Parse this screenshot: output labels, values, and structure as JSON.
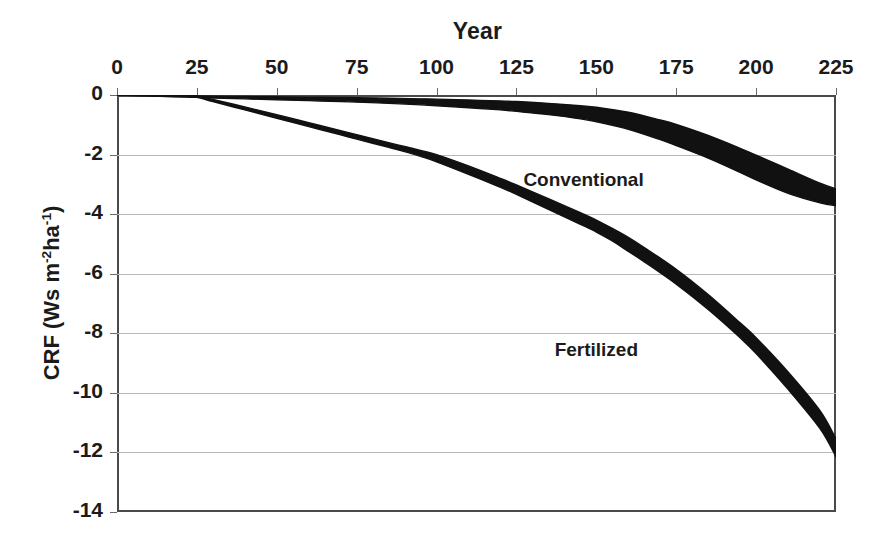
{
  "chart_data": {
    "type": "line",
    "title": "Year",
    "xlabel": "Year",
    "ylabel": "CRF (Ws m-2ha-1)",
    "ylabel_parts": {
      "prefix": "CRF (Ws m",
      "sup1": "-2",
      "mid": "ha",
      "sup2": "-1",
      "suffix": ")"
    },
    "xlim": [
      0,
      225
    ],
    "ylim": [
      -14,
      0
    ],
    "grid": true,
    "grid_axis": "y",
    "legend_position": "inline-annotation",
    "xticks": [
      0,
      25,
      50,
      75,
      100,
      125,
      150,
      175,
      200,
      225
    ],
    "xtick_labels": [
      "0",
      "25",
      "50",
      "75",
      "100",
      "125",
      "150",
      "175",
      "200",
      "225"
    ],
    "yticks": [
      0,
      -2,
      -4,
      -6,
      -8,
      -10,
      -12,
      -14
    ],
    "ytick_labels": [
      "0",
      "-2",
      "-4",
      "-6",
      "-8",
      "-10",
      "-12",
      "-14"
    ],
    "series": [
      {
        "name": "Conventional",
        "band": true,
        "color": "#111111",
        "x": [
          0,
          10,
          20,
          25,
          30,
          40,
          50,
          60,
          70,
          75,
          85,
          95,
          100,
          110,
          120,
          125,
          135,
          145,
          150,
          160,
          170,
          175,
          185,
          195,
          200,
          210,
          220,
          225
        ],
        "upper": [
          0.0,
          -0.01,
          -0.02,
          -0.03,
          -0.04,
          -0.05,
          -0.06,
          -0.07,
          -0.08,
          -0.09,
          -0.11,
          -0.13,
          -0.14,
          -0.17,
          -0.2,
          -0.22,
          -0.28,
          -0.36,
          -0.41,
          -0.58,
          -0.84,
          -0.99,
          -1.36,
          -1.79,
          -2.02,
          -2.49,
          -2.96,
          -3.15
        ],
        "lower": [
          0.0,
          -0.03,
          -0.06,
          -0.08,
          -0.1,
          -0.13,
          -0.16,
          -0.19,
          -0.22,
          -0.24,
          -0.28,
          -0.33,
          -0.36,
          -0.43,
          -0.5,
          -0.55,
          -0.66,
          -0.8,
          -0.9,
          -1.15,
          -1.5,
          -1.7,
          -2.12,
          -2.6,
          -2.85,
          -3.3,
          -3.62,
          -3.72
        ]
      },
      {
        "name": "Fertilized",
        "band": true,
        "color": "#111111",
        "x": [
          0,
          10,
          20,
          25,
          30,
          40,
          50,
          60,
          70,
          75,
          85,
          90,
          95,
          100,
          110,
          120,
          125,
          135,
          145,
          150,
          155,
          160,
          165,
          175,
          185,
          195,
          200,
          210,
          220,
          225
        ],
        "upper": [
          0.0,
          -0.01,
          -0.02,
          -0.03,
          -0.15,
          -0.4,
          -0.66,
          -0.93,
          -1.2,
          -1.33,
          -1.6,
          -1.73,
          -1.86,
          -2.0,
          -2.38,
          -2.8,
          -3.02,
          -3.48,
          -3.95,
          -4.2,
          -4.48,
          -4.78,
          -5.12,
          -5.85,
          -6.7,
          -7.65,
          -8.15,
          -9.3,
          -10.6,
          -11.55
        ],
        "lower": [
          0.0,
          -0.03,
          -0.06,
          -0.08,
          -0.22,
          -0.5,
          -0.78,
          -1.06,
          -1.34,
          -1.48,
          -1.76,
          -1.9,
          -2.06,
          -2.24,
          -2.66,
          -3.1,
          -3.34,
          -3.84,
          -4.34,
          -4.6,
          -4.9,
          -5.25,
          -5.6,
          -6.35,
          -7.2,
          -8.15,
          -8.68,
          -9.88,
          -11.2,
          -12.15
        ]
      }
    ],
    "annotations": [
      {
        "text": "Conventional",
        "x": 146,
        "y": -2.9
      },
      {
        "text": "Fertilized",
        "x": 150,
        "y": -8.6
      }
    ]
  }
}
